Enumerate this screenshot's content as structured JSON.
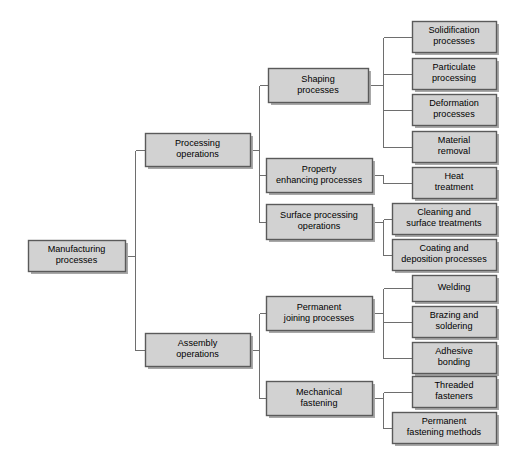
{
  "diagram": {
    "style": {
      "box_fill": "#d2d2d2",
      "box_border": "#5a5a5a",
      "shadow": "#a8a8a8",
      "connector": "#6e6e6e",
      "background": "#ffffff",
      "text": "#000000"
    },
    "nodes": [
      {
        "id": "root",
        "name": "manufacturing-processes",
        "lines": [
          "Manufacturing",
          "processes"
        ],
        "x": 28,
        "y": 240,
        "w": 97,
        "h": 31
      },
      {
        "id": "processing",
        "name": "processing-operations",
        "lines": [
          "Processing",
          "operations"
        ],
        "x": 145,
        "y": 133,
        "w": 105,
        "h": 33
      },
      {
        "id": "assembly",
        "name": "assembly-operations",
        "lines": [
          "Assembly",
          "operations"
        ],
        "x": 145,
        "y": 333,
        "w": 105,
        "h": 33
      },
      {
        "id": "shaping",
        "name": "shaping-processes",
        "lines": [
          "Shaping",
          "processes"
        ],
        "x": 268,
        "y": 68,
        "w": 100,
        "h": 34
      },
      {
        "id": "property",
        "name": "property-enhancing-processes",
        "lines": [
          "Property",
          "enhancing processes"
        ],
        "x": 266,
        "y": 158,
        "w": 106,
        "h": 34
      },
      {
        "id": "surface",
        "name": "surface-processing-operations",
        "lines": [
          "Surface processing",
          "operations"
        ],
        "x": 266,
        "y": 204,
        "w": 106,
        "h": 35
      },
      {
        "id": "permanent-joining",
        "name": "permanent-joining-processes",
        "lines": [
          "Permanent",
          "joining processes"
        ],
        "x": 266,
        "y": 296,
        "w": 106,
        "h": 34
      },
      {
        "id": "mechanical",
        "name": "mechanical-fastening",
        "lines": [
          "Mechanical",
          "fastening"
        ],
        "x": 266,
        "y": 381,
        "w": 106,
        "h": 34
      },
      {
        "id": "solidification",
        "name": "solidification-processes",
        "lines": [
          "Solidification",
          "processes"
        ],
        "x": 412,
        "y": 21,
        "w": 84,
        "h": 31
      },
      {
        "id": "particulate",
        "name": "particulate-processing",
        "lines": [
          "Particulate",
          "processing"
        ],
        "x": 412,
        "y": 58,
        "w": 84,
        "h": 31
      },
      {
        "id": "deformation",
        "name": "deformation-processes",
        "lines": [
          "Deformation",
          "processes"
        ],
        "x": 412,
        "y": 94,
        "w": 84,
        "h": 31
      },
      {
        "id": "material-removal",
        "name": "material-removal",
        "lines": [
          "Material",
          "removal"
        ],
        "x": 412,
        "y": 131,
        "w": 84,
        "h": 31
      },
      {
        "id": "heat-treatment",
        "name": "heat-treatment",
        "lines": [
          "Heat",
          "treatment"
        ],
        "x": 412,
        "y": 167,
        "w": 84,
        "h": 31
      },
      {
        "id": "cleaning",
        "name": "cleaning-and-surface-treatments",
        "lines": [
          "Cleaning and",
          "surface treatments"
        ],
        "x": 392,
        "y": 203,
        "w": 104,
        "h": 31
      },
      {
        "id": "coating",
        "name": "coating-and-deposition-processes",
        "lines": [
          "Coating and",
          "deposition processes"
        ],
        "x": 392,
        "y": 239,
        "w": 104,
        "h": 31
      },
      {
        "id": "welding",
        "name": "welding",
        "lines": [
          "Welding"
        ],
        "x": 412,
        "y": 275,
        "w": 84,
        "h": 26
      },
      {
        "id": "brazing",
        "name": "brazing-and-soldering",
        "lines": [
          "Brazing and",
          "soldering"
        ],
        "x": 412,
        "y": 306,
        "w": 84,
        "h": 31
      },
      {
        "id": "adhesive",
        "name": "adhesive-bonding",
        "lines": [
          "Adhesive",
          "bonding"
        ],
        "x": 412,
        "y": 342,
        "w": 84,
        "h": 31
      },
      {
        "id": "threaded",
        "name": "threaded-fasteners",
        "lines": [
          "Threaded",
          "fasteners"
        ],
        "x": 412,
        "y": 376,
        "w": 84,
        "h": 31
      },
      {
        "id": "permanent-fastening",
        "name": "permanent-fastening-methods",
        "lines": [
          "Permanent",
          "fastening methods"
        ],
        "x": 392,
        "y": 412,
        "w": 104,
        "h": 31
      }
    ],
    "edges": [
      {
        "name": "edge-root-to-level2",
        "parent": "root",
        "bus_x": 135,
        "children": [
          "processing",
          "assembly"
        ]
      },
      {
        "name": "edge-processing-to-level3",
        "parent": "processing",
        "bus_x": 259,
        "children": [
          "shaping",
          "property",
          "surface"
        ]
      },
      {
        "name": "edge-assembly-to-level3",
        "parent": "assembly",
        "bus_x": 259,
        "children": [
          "permanent-joining",
          "mechanical"
        ]
      },
      {
        "name": "edge-shaping-to-leaves",
        "parent": "shaping",
        "bus_x": 383,
        "children": [
          "solidification",
          "particulate",
          "deformation",
          "material-removal"
        ]
      },
      {
        "name": "edge-property-to-leaves",
        "parent": "property",
        "bus_x": 383,
        "children": [
          "heat-treatment"
        ]
      },
      {
        "name": "edge-surface-to-leaves",
        "parent": "surface",
        "bus_x": 383,
        "children": [
          "cleaning",
          "coating"
        ]
      },
      {
        "name": "edge-permanent-joining-to-leaves",
        "parent": "permanent-joining",
        "bus_x": 383,
        "children": [
          "welding",
          "brazing",
          "adhesive"
        ]
      },
      {
        "name": "edge-mechanical-to-leaves",
        "parent": "mechanical",
        "bus_x": 383,
        "children": [
          "threaded",
          "permanent-fastening"
        ]
      }
    ]
  }
}
